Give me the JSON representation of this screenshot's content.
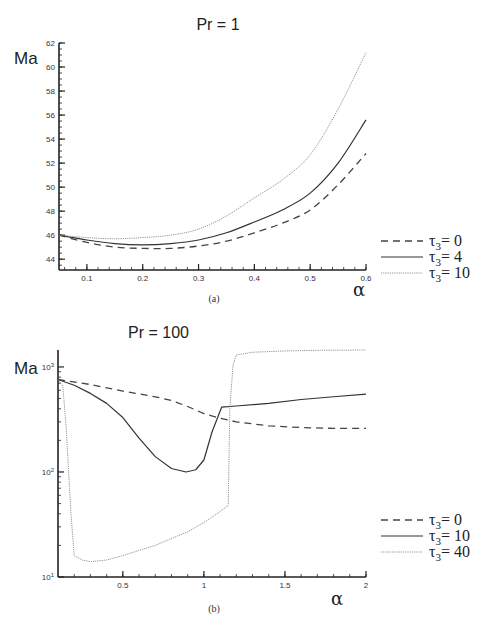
{
  "chart_data": [
    {
      "type": "line",
      "panel": "(a)",
      "title": "Pr = 1",
      "xlabel": "α",
      "ylabel": "Ma",
      "xlim": [
        0.05,
        0.6
      ],
      "ylim": [
        43.1,
        62
      ],
      "yscale": "linear",
      "xticks": [
        0.1,
        0.2,
        0.3,
        0.4,
        0.5,
        0.6
      ],
      "xtick_labels": [
        "0.1",
        "0.2",
        "0.3",
        "0.4",
        "0.5",
        "0.6"
      ],
      "yticks": [
        44,
        46,
        48,
        50,
        52,
        54,
        56,
        58,
        60,
        62
      ],
      "ytick_labels": [
        "44",
        "46",
        "48",
        "50",
        "52",
        "54",
        "56",
        "58",
        "60",
        "62"
      ],
      "grid": false,
      "legend_position": "right",
      "x": [
        0.05,
        0.1,
        0.15,
        0.2,
        0.25,
        0.3,
        0.35,
        0.4,
        0.45,
        0.5,
        0.55,
        0.6
      ],
      "series": [
        {
          "name": "τ3 = 0",
          "style": "dashed",
          "values": [
            46.0,
            45.4,
            45.0,
            44.9,
            44.9,
            45.1,
            45.5,
            46.2,
            47.0,
            48.1,
            50.2,
            52.8
          ]
        },
        {
          "name": "τ3 = 4",
          "style": "solid",
          "values": [
            46.0,
            45.6,
            45.3,
            45.2,
            45.3,
            45.6,
            46.2,
            47.1,
            48.1,
            49.5,
            52.0,
            55.6
          ]
        },
        {
          "name": "τ3 = 10",
          "style": "dotted",
          "values": [
            46.0,
            45.8,
            45.7,
            45.8,
            46.0,
            46.5,
            47.6,
            49.1,
            50.6,
            52.7,
            56.5,
            61.2
          ]
        }
      ]
    },
    {
      "type": "line",
      "panel": "(b)",
      "title": "Pr = 100",
      "xlabel": "α",
      "ylabel": "Ma",
      "xlim": [
        0.1,
        2
      ],
      "ylim": [
        10,
        1450
      ],
      "yscale": "log",
      "xticks": [
        0.5,
        1,
        1.5,
        2
      ],
      "xtick_labels": [
        "0.5",
        "1",
        "1.5",
        "2"
      ],
      "yticks": [
        10,
        100,
        1000
      ],
      "ytick_labels": [
        "10¹",
        "10²",
        "10³"
      ],
      "grid": false,
      "legend_position": "right",
      "series": [
        {
          "name": "τ3 = 0",
          "style": "dashed",
          "x": [
            0.1,
            0.3,
            0.5,
            0.7,
            0.8,
            0.9,
            1.0,
            1.1,
            1.2,
            1.4,
            1.6,
            1.8,
            2.0
          ],
          "values": [
            760,
            680,
            590,
            520,
            480,
            420,
            360,
            325,
            300,
            275,
            265,
            260,
            260
          ]
        },
        {
          "name": "τ3 = 10",
          "style": "solid",
          "x": [
            0.1,
            0.2,
            0.3,
            0.4,
            0.5,
            0.6,
            0.7,
            0.8,
            0.89,
            0.95,
            1.0,
            1.05,
            1.11,
            1.2,
            1.4,
            1.6,
            1.8,
            2.0
          ],
          "values": [
            760,
            670,
            560,
            450,
            330,
            210,
            140,
            108,
            100,
            105,
            130,
            240,
            415,
            425,
            450,
            490,
            520,
            550
          ]
        },
        {
          "name": "τ3 = 40",
          "style": "dotted",
          "x": [
            0.1,
            0.13,
            0.15,
            0.18,
            0.2,
            0.25,
            0.3,
            0.4,
            0.5,
            0.7,
            0.9,
            1.0,
            1.1,
            1.15,
            1.16,
            1.18,
            1.2,
            1.3,
            1.5,
            1.7,
            2.0
          ],
          "values": [
            760,
            650,
            270,
            40,
            16,
            14.5,
            14,
            14.5,
            16,
            20,
            27,
            33,
            42,
            48,
            400,
            1050,
            1300,
            1380,
            1420,
            1440,
            1450
          ]
        }
      ]
    }
  ],
  "panels": {
    "a": {
      "title": "Pr = 1",
      "ylabel": "Ma",
      "xlabel": "α",
      "caption": "(a)",
      "legend": [
        {
          "prefix": "τ",
          "sub": "3",
          "suffix": "=  0",
          "style": "dashed"
        },
        {
          "prefix": "τ",
          "sub": "3",
          "suffix": "=  4",
          "style": "solid"
        },
        {
          "prefix": "τ",
          "sub": "3",
          "suffix": "= 10",
          "style": "dotted"
        }
      ]
    },
    "b": {
      "title": "Pr = 100",
      "ylabel": "Ma",
      "xlabel": "α",
      "caption": "(b)",
      "legend": [
        {
          "prefix": "τ",
          "sub": "3",
          "suffix": "=  0",
          "style": "dashed"
        },
        {
          "prefix": "τ",
          "sub": "3",
          "suffix": "= 10",
          "style": "solid"
        },
        {
          "prefix": "τ",
          "sub": "3",
          "suffix": "= 40",
          "style": "dotted"
        }
      ]
    }
  },
  "colors": {
    "axis": "#222222",
    "dashed": "#444444",
    "solid": "#333333",
    "dotted": "#888888"
  }
}
